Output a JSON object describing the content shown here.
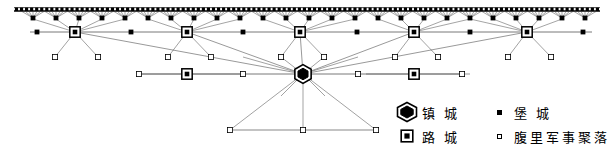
{
  "figure": {
    "type": "settlement-hierarchy-network-diagram"
  },
  "legend": {
    "name": "map-legend",
    "rows": [
      {
        "left": {
          "symbol": "hexagon-double-filled",
          "label": "镇 城"
        },
        "right": {
          "symbol": "small-filled-square",
          "label": "堡 城"
        }
      },
      {
        "left": {
          "symbol": "square-in-square",
          "label": "路 城"
        },
        "right": {
          "symbol": "small-open-square",
          "label": "腹里军事聚落"
        }
      }
    ]
  },
  "colors": {
    "ink": "#000000",
    "line": "#555555",
    "background": "#ffffff"
  },
  "chart_data": {
    "type": "network",
    "title": "",
    "wall": {
      "label": "great-wall",
      "y": 11,
      "x_start": 14,
      "x_end": 600,
      "spike_count": 116
    },
    "nodes": {
      "zhen_cheng": [
        {
          "id": "Z1",
          "x": 303,
          "y": 74
        }
      ],
      "lu_cheng": [
        {
          "id": "L1",
          "x": 75,
          "y": 32
        },
        {
          "id": "L2",
          "x": 187,
          "y": 32
        },
        {
          "id": "L3",
          "x": 300,
          "y": 32
        },
        {
          "id": "L4",
          "x": 414,
          "y": 32
        },
        {
          "id": "L5",
          "x": 527,
          "y": 32
        },
        {
          "id": "L6",
          "x": 187,
          "y": 74
        },
        {
          "id": "L7",
          "x": 414,
          "y": 74
        }
      ],
      "bao_cheng_wall": [
        {
          "x": 33,
          "y": 18
        },
        {
          "x": 56,
          "y": 18
        },
        {
          "x": 79,
          "y": 18
        },
        {
          "x": 102,
          "y": 18
        },
        {
          "x": 125,
          "y": 18
        },
        {
          "x": 148,
          "y": 18
        },
        {
          "x": 171,
          "y": 18
        },
        {
          "x": 194,
          "y": 18
        },
        {
          "x": 217,
          "y": 18
        },
        {
          "x": 240,
          "y": 18
        },
        {
          "x": 263,
          "y": 18
        },
        {
          "x": 286,
          "y": 18
        },
        {
          "x": 309,
          "y": 18
        },
        {
          "x": 332,
          "y": 18
        },
        {
          "x": 355,
          "y": 18
        },
        {
          "x": 378,
          "y": 18
        },
        {
          "x": 401,
          "y": 18
        },
        {
          "x": 424,
          "y": 18
        },
        {
          "x": 447,
          "y": 18
        },
        {
          "x": 470,
          "y": 18
        },
        {
          "x": 493,
          "y": 18
        },
        {
          "x": 516,
          "y": 18
        },
        {
          "x": 539,
          "y": 18
        },
        {
          "x": 562,
          "y": 18
        },
        {
          "x": 585,
          "y": 18
        }
      ],
      "bao_cheng_row": [
        {
          "x": 37,
          "y": 32
        },
        {
          "x": 131,
          "y": 32
        },
        {
          "x": 243,
          "y": 32
        },
        {
          "x": 357,
          "y": 32
        },
        {
          "x": 470,
          "y": 32
        },
        {
          "x": 583,
          "y": 32
        }
      ],
      "fuli_outposts": [
        {
          "x": 55,
          "y": 57
        },
        {
          "x": 98,
          "y": 57
        },
        {
          "x": 168,
          "y": 57
        },
        {
          "x": 211,
          "y": 57
        },
        {
          "x": 281,
          "y": 57
        },
        {
          "x": 324,
          "y": 57
        },
        {
          "x": 395,
          "y": 57
        },
        {
          "x": 438,
          "y": 57
        },
        {
          "x": 508,
          "y": 57
        },
        {
          "x": 551,
          "y": 57
        },
        {
          "x": 139,
          "y": 74
        },
        {
          "x": 243,
          "y": 74
        },
        {
          "x": 358,
          "y": 74
        },
        {
          "x": 462,
          "y": 74
        },
        {
          "x": 230,
          "y": 130
        },
        {
          "x": 303,
          "y": 130
        },
        {
          "x": 376,
          "y": 130
        }
      ]
    },
    "edges_description": "Each lu-cheng fans up to the wall section and down to two fuli outposts; the central zhen-cheng connects horizontally to two lu-cheng and outposts, diagonally up to all five wall-line lu-cheng, and down to three outposts on a baseline."
  }
}
